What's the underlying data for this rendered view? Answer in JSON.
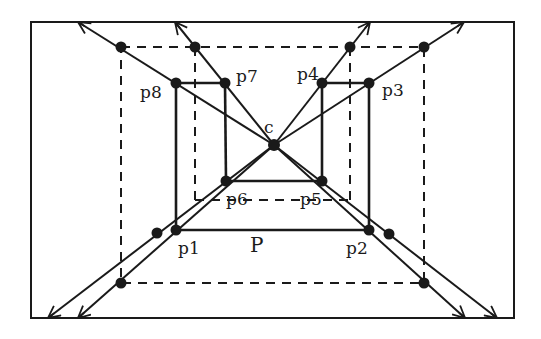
{
  "diagram": {
    "type": "perspective-projection-figure",
    "colors": {
      "ink": "#1a1a1a",
      "background": "#ffffff"
    },
    "frame": {
      "x": 31,
      "y": 22,
      "w": 483,
      "h": 296
    },
    "center": {
      "name": "c",
      "label": "c",
      "x": 274,
      "y": 145
    },
    "polygon_label": {
      "text": "P",
      "x": 250,
      "y": 252
    },
    "points": [
      {
        "name": "p1",
        "label": "p1",
        "x": 176,
        "y": 230,
        "lx": 178,
        "ly": 254
      },
      {
        "name": "p2",
        "label": "p2",
        "x": 369,
        "y": 230,
        "lx": 346,
        "ly": 254
      },
      {
        "name": "p3",
        "label": "p3",
        "x": 369,
        "y": 83,
        "lx": 382,
        "ly": 96
      },
      {
        "name": "p4",
        "label": "p4",
        "x": 322,
        "y": 83,
        "lx": 297,
        "ly": 80
      },
      {
        "name": "p5",
        "label": "p5",
        "x": 322,
        "y": 181,
        "lx": 300,
        "ly": 205
      },
      {
        "name": "p6",
        "label": "p6",
        "x": 226,
        "y": 181,
        "lx": 226,
        "ly": 205
      },
      {
        "name": "p7",
        "label": "p7",
        "x": 225,
        "y": 83,
        "lx": 236,
        "ly": 82
      },
      {
        "name": "p8",
        "label": "p8",
        "x": 176,
        "y": 83,
        "lx": 140,
        "ly": 98
      }
    ],
    "solid_edges": [
      [
        "p8",
        "p7"
      ],
      [
        "p4",
        "p3"
      ],
      [
        "p8",
        "p1"
      ],
      [
        "p7",
        "p6"
      ],
      [
        "p4",
        "p5"
      ],
      [
        "p3",
        "p2"
      ],
      [
        "p6",
        "p5"
      ],
      [
        "p1",
        "p2"
      ]
    ],
    "dashed_rect": {
      "x1": 121,
      "y1": 47,
      "x2": 424,
      "y2": 283
    },
    "dashed_inner": {
      "left_x": 195,
      "right_x": 350,
      "top_y": 47,
      "bottom_y": 200
    },
    "projected_dots": [
      {
        "x": 121,
        "y": 47
      },
      {
        "x": 195,
        "y": 47
      },
      {
        "x": 350,
        "y": 47
      },
      {
        "x": 424,
        "y": 47
      },
      {
        "x": 157,
        "y": 233
      },
      {
        "x": 121,
        "y": 283
      },
      {
        "x": 389,
        "y": 234
      },
      {
        "x": 424,
        "y": 283
      }
    ],
    "rays": [
      {
        "from": "c",
        "to": {
          "x": 78,
          "y": 22
        }
      },
      {
        "from": "c",
        "to": {
          "x": 175,
          "y": 22
        }
      },
      {
        "from": "c",
        "to": {
          "x": 370,
          "y": 22
        }
      },
      {
        "from": "c",
        "to": {
          "x": 464,
          "y": 22
        }
      },
      {
        "from": "c",
        "to": {
          "x": 48,
          "y": 318
        }
      },
      {
        "from": "c",
        "to": {
          "x": 78,
          "y": 318
        }
      },
      {
        "from": "c",
        "to": {
          "x": 465,
          "y": 318
        }
      },
      {
        "from": "c",
        "to": {
          "x": 497,
          "y": 318
        }
      }
    ]
  }
}
